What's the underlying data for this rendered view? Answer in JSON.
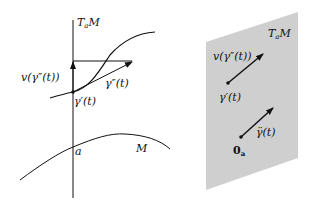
{
  "colors": {
    "background": "#ffffff",
    "plane_fill": "#cfcfcf",
    "stroke": "#111111"
  },
  "left_diagram": {
    "tangent_space_label": {
      "main": "T",
      "sub": "a",
      "tail": "M"
    },
    "vertical_component_label": "v(γ″(t))",
    "acceleration_label": "γ″(t)",
    "velocity_label": "γ′(t)",
    "point_label": "a",
    "manifold_label": "M"
  },
  "right_diagram": {
    "tangent_space_label": {
      "main": "T",
      "sub": "a",
      "tail": "M"
    },
    "vertical_component_label": "v(γ″(t))",
    "velocity_label": "γ′(t)",
    "covariant_accel_label": "γ̈(t)",
    "zero_label": {
      "main": "0",
      "sub": "a"
    }
  }
}
